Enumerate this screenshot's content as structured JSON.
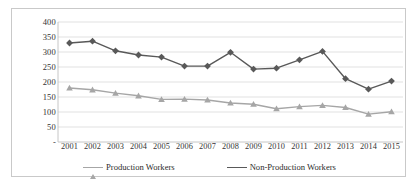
{
  "chart_data": {
    "type": "line",
    "title": "",
    "xlabel": "",
    "ylabel": "",
    "categories": [
      "2001",
      "2002",
      "2003",
      "2004",
      "2005",
      "2006",
      "2007",
      "2008",
      "2009",
      "2010",
      "2011",
      "2012",
      "2013",
      "2014",
      "2015"
    ],
    "ylim": [
      0,
      400
    ],
    "yticks": [
      0,
      50,
      100,
      150,
      200,
      250,
      300,
      350,
      400
    ],
    "ytick_labels": [
      "-",
      "50",
      "100",
      "150",
      "200",
      "250",
      "300",
      "350",
      "400"
    ],
    "grid": true,
    "legend_position": "bottom",
    "series": [
      {
        "name": "Production Workers",
        "color": "#a6a6a6",
        "marker": "triangle",
        "values": [
          180,
          174,
          163,
          154,
          142,
          143,
          140,
          130,
          126,
          111,
          118,
          122,
          115,
          93,
          101
        ]
      },
      {
        "name": "Non-Production Workers",
        "color": "#595959",
        "marker": "diamond",
        "values": [
          330,
          336,
          304,
          290,
          283,
          253,
          253,
          299,
          243,
          246,
          274,
          302,
          211,
          176,
          203
        ]
      }
    ]
  },
  "legend": {
    "items": [
      {
        "label": "Production Workers"
      },
      {
        "label": "Non-Production Workers"
      }
    ]
  },
  "colors": {
    "production": "#a6a6a6",
    "non_production": "#595959",
    "grid": "#d9d9d9",
    "axis": "#bfbfbf",
    "border": "#c9c9c9"
  }
}
